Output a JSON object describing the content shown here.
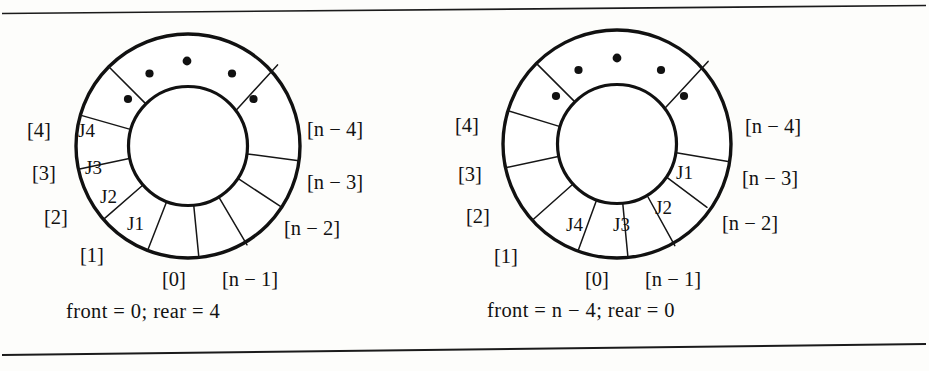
{
  "figure": {
    "background_color": "#fdfdfb",
    "ink_color": "#121212",
    "rule_color": "#1b1b1b",
    "top_rule": "horizontal-rule",
    "bottom_rule": "horizontal-rule"
  },
  "diagrams": [
    {
      "id": "left-ring",
      "caption": "front = 0;  rear = 4",
      "caption_parts": {
        "front_word": "front",
        "front_value": "0",
        "rear_word": "rear",
        "rear_value": "4"
      },
      "slot_labels": {
        "zero": "[0]",
        "one": "[1]",
        "two": "[2]",
        "three": "[3]",
        "four": "[4]",
        "n_minus_1": "[n − 1]",
        "n_minus_2": "[n − 2]",
        "n_minus_3": "[n − 3]",
        "n_minus_4": "[n − 4]"
      },
      "jobs": {
        "j1": "J1",
        "j2": "J2",
        "j3": "J3",
        "j4": "J4"
      },
      "ellipsis_dot_count": 5
    },
    {
      "id": "right-ring",
      "caption": "front = n − 4;  rear = 0",
      "caption_parts": {
        "front_word": "front",
        "front_value": "n − 4",
        "rear_word": "rear",
        "rear_value": "0"
      },
      "slot_labels": {
        "zero": "[0]",
        "one": "[1]",
        "two": "[2]",
        "three": "[3]",
        "four": "[4]",
        "n_minus_1": "[n − 1]",
        "n_minus_2": "[n − 2]",
        "n_minus_3": "[n − 3]",
        "n_minus_4": "[n − 4]"
      },
      "jobs": {
        "j1": "J1",
        "j2": "J2",
        "j3": "J3",
        "j4": "J4"
      },
      "ellipsis_dot_count": 5
    }
  ]
}
